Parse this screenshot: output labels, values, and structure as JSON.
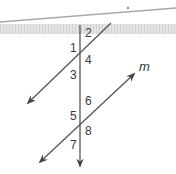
{
  "figure": {
    "colors": {
      "line": "#555555",
      "band": "#d9d9d9",
      "top_line": "#a8a8a8",
      "text": "#3a3a3a"
    },
    "lines": {
      "transversal": {
        "x1": 80,
        "y1": 25,
        "x2": 80,
        "y2": 166
      },
      "upper_parallel": {
        "x1": 111,
        "y1": 23,
        "x2": 28,
        "y2": 103
      },
      "lower_parallel_m": {
        "x1": 134,
        "y1": 74,
        "x2": 40,
        "y2": 162
      }
    },
    "line_label": "m",
    "angle_labels": [
      {
        "id": "1",
        "text": "1",
        "x": 70,
        "y": 52
      },
      {
        "id": "2",
        "text": "2",
        "x": 85,
        "y": 37
      },
      {
        "id": "3",
        "text": "3",
        "x": 70,
        "y": 79
      },
      {
        "id": "4",
        "text": "4",
        "x": 85,
        "y": 64
      },
      {
        "id": "5",
        "text": "5",
        "x": 70,
        "y": 120
      },
      {
        "id": "6",
        "text": "6",
        "x": 85,
        "y": 105
      },
      {
        "id": "7",
        "text": "7",
        "x": 70,
        "y": 149
      },
      {
        "id": "8",
        "text": "8",
        "x": 85,
        "y": 135
      }
    ]
  }
}
